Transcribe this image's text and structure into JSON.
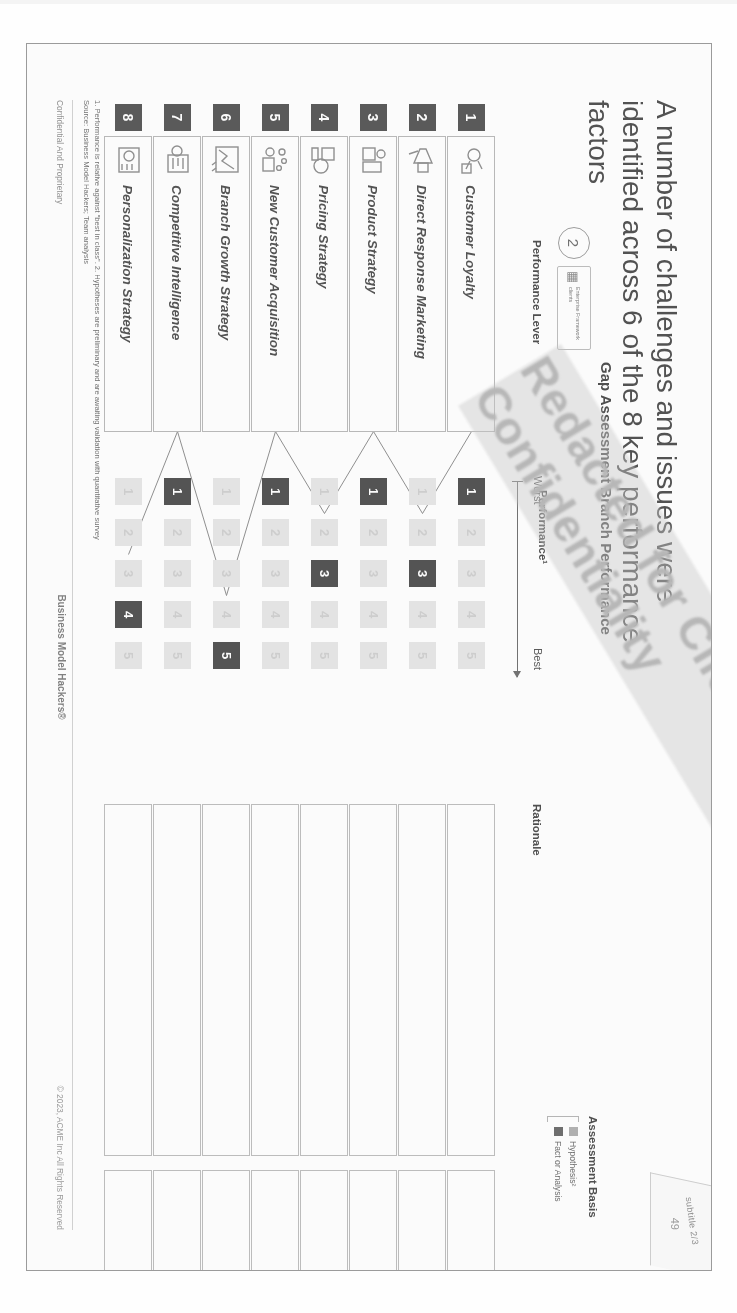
{
  "scan": {
    "corner_label": "subtitle 2/3"
  },
  "slide": {
    "title": "A number of challenges and issues were identified across 6 of the 8 key performance factors",
    "chart_title": "Gap Assessment Branch Performance",
    "page_number": "49",
    "framework_chip": {
      "glyph": "grid-icon",
      "label": "Enterprise Framework clients",
      "badge": "2"
    },
    "columns": {
      "lever": "Performance Lever",
      "performance": "Performance¹",
      "rationale": "Rationale",
      "assessment": "Assessment Basis"
    },
    "axis": {
      "worst": "Worst",
      "best": "Best"
    },
    "legend": {
      "title": "Assessment Basis",
      "items": [
        {
          "label": "Hypothesis²",
          "color": "#b0b0b0"
        },
        {
          "label": "Fact or Analysis",
          "color": "#6a6a6a"
        }
      ]
    },
    "footnotes": [
      "1. Performance is relative against “best in class”.   2.  Hypotheses are preliminary and are awaiting validation with quantitative survey",
      "Source: Business Model Hackers; Team analysis"
    ],
    "footer": {
      "left": "Confidential And Proprietary",
      "center": "Business Model Hackers®",
      "right": "© 2023, ACME Inc All Rights Reserved"
    },
    "watermark": "Redacted for Client Confidentiality"
  },
  "chart_data": {
    "type": "bar",
    "title": "Gap Assessment Branch Performance",
    "xlabel": "Performance¹",
    "ylabel": "Performance Lever",
    "scale_min": 1,
    "scale_max": 5,
    "scale_labels": [
      "1",
      "2",
      "3",
      "4",
      "5"
    ],
    "axis_endpoints": [
      "Worst",
      "Best"
    ],
    "categories": [
      "Customer Loyalty",
      "Direct Response Marketing",
      "Product Strategy",
      "Pricing Strategy",
      "New Customer Acquisition",
      "Branch Growth Strategy",
      "Competitive Intelligence",
      "Personalization Strategy"
    ],
    "values": [
      1,
      3,
      1,
      3,
      1,
      5,
      1,
      4
    ],
    "grid": false,
    "legend": [
      "Hypothesis²",
      "Fact or Analysis"
    ]
  },
  "rows": [
    {
      "num": "1",
      "name": "Customer Loyalty",
      "icon": "loyalty-heart-icon",
      "score": 1
    },
    {
      "num": "2",
      "name": "Direct Response Marketing",
      "icon": "megaphone-icon",
      "score": 3
    },
    {
      "num": "3",
      "name": "Product Strategy",
      "icon": "product-box-icon",
      "score": 1
    },
    {
      "num": "4",
      "name": "Pricing Strategy",
      "icon": "price-tag-icon",
      "score": 3
    },
    {
      "num": "5",
      "name": "New Customer Acquisition",
      "icon": "customer-funnel-icon",
      "score": 1
    },
    {
      "num": "6",
      "name": "Branch Growth Strategy",
      "icon": "growth-chart-icon",
      "score": 5
    },
    {
      "num": "7",
      "name": "Competitive Intelligence",
      "icon": "compete-board-icon",
      "score": 1
    },
    {
      "num": "8",
      "name": "Personalization Strategy",
      "icon": "persona-gear-icon",
      "score": 4
    }
  ]
}
